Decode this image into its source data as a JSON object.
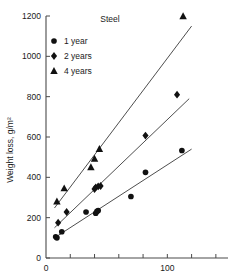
{
  "chart_data": {
    "type": "scatter",
    "title": "Steel",
    "xlabel": "",
    "ylabel": "Weight loss, g/m²",
    "xlim": [
      0,
      150
    ],
    "ylim": [
      0,
      1200
    ],
    "grid": false,
    "legend_position": "top-left",
    "x_ticks": [
      0,
      20,
      40,
      60,
      80,
      100,
      120,
      140
    ],
    "x_tick_labels": [
      "0",
      "",
      "",
      "",
      "",
      "100",
      "",
      ""
    ],
    "y_ticks": [
      0,
      200,
      400,
      600,
      800,
      1000,
      1200
    ],
    "y_tick_labels": [
      "0",
      "200",
      "400",
      "600",
      "800",
      "1000",
      "1200"
    ],
    "series": [
      {
        "name": "1 year",
        "marker": "circle",
        "color": "#111111",
        "points": [
          {
            "x": 8,
            "y": 105
          },
          {
            "x": 9,
            "y": 100
          },
          {
            "x": 13,
            "y": 130
          },
          {
            "x": 33,
            "y": 228
          },
          {
            "x": 41,
            "y": 222
          },
          {
            "x": 42,
            "y": 232
          },
          {
            "x": 43,
            "y": 235
          },
          {
            "x": 70,
            "y": 305
          },
          {
            "x": 82,
            "y": 425
          },
          {
            "x": 112,
            "y": 533
          }
        ],
        "trend": {
          "x1": 7,
          "y1": 100,
          "x2": 120,
          "y2": 540
        }
      },
      {
        "name": "2 years",
        "marker": "diamond",
        "color": "#111111",
        "points": [
          {
            "x": 10,
            "y": 175
          },
          {
            "x": 17,
            "y": 228
          },
          {
            "x": 40,
            "y": 342
          },
          {
            "x": 41,
            "y": 350
          },
          {
            "x": 43,
            "y": 355
          },
          {
            "x": 45,
            "y": 357
          },
          {
            "x": 82,
            "y": 607
          },
          {
            "x": 108,
            "y": 810
          }
        ],
        "trend": {
          "x1": 7,
          "y1": 150,
          "x2": 118,
          "y2": 790
        }
      },
      {
        "name": "4 years",
        "marker": "triangle",
        "color": "#111111",
        "points": [
          {
            "x": 9,
            "y": 280
          },
          {
            "x": 15,
            "y": 345
          },
          {
            "x": 37,
            "y": 450
          },
          {
            "x": 40,
            "y": 492
          },
          {
            "x": 44,
            "y": 540
          },
          {
            "x": 113,
            "y": 1198
          }
        ],
        "trend": {
          "x1": 7,
          "y1": 248,
          "x2": 120,
          "y2": 1150
        }
      }
    ]
  },
  "legend": {
    "items": [
      {
        "label": "1 year",
        "marker": "circle"
      },
      {
        "label": "2 years",
        "marker": "diamond"
      },
      {
        "label": "4 years",
        "marker": "triangle"
      }
    ]
  }
}
